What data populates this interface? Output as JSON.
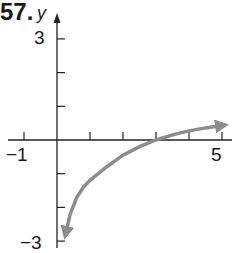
{
  "problem_number": "57.",
  "chart_data": {
    "type": "line",
    "title": "",
    "xlabel": "",
    "ylabel": "y",
    "xlim": [
      -1,
      5
    ],
    "ylim": [
      -3,
      3
    ],
    "x_tick_labels": [
      "-1",
      "5"
    ],
    "y_tick_labels": [
      "3",
      "-3"
    ],
    "x_ticks": [
      -1,
      1,
      2,
      3,
      4,
      5
    ],
    "y_ticks": [
      -3,
      -2,
      -1,
      1,
      2,
      3
    ],
    "grid": false,
    "series": [
      {
        "name": "curve",
        "color": "#8c8c8c",
        "arrows": "both",
        "x": [
          0.27,
          0.4,
          0.6,
          0.8,
          1,
          1.5,
          2,
          2.5,
          3,
          3.5,
          4,
          4.5,
          5
        ],
        "y": [
          -2.76,
          -2.2,
          -1.7,
          -1.4,
          -1.2,
          -0.8,
          -0.45,
          -0.2,
          0,
          0.15,
          0.27,
          0.36,
          0.43
        ]
      }
    ],
    "annotations": [
      "x-intercept at (3, 0)"
    ]
  },
  "labels": {
    "x_neg": "−1",
    "x_pos": "5",
    "y_pos": "3",
    "y_neg": "−3",
    "y_axis": "y"
  }
}
